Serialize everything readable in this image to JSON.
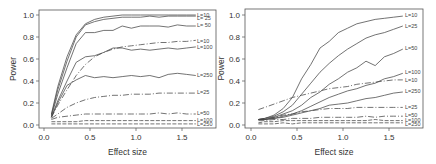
{
  "chart_data": [
    {
      "type": "line",
      "panel": "left",
      "title": "",
      "xlabel": "Effect size",
      "ylabel": "Power",
      "xlim": [
        -0.05,
        1.85
      ],
      "ylim": [
        -0.03,
        1.05
      ],
      "xticks": [
        "0.0",
        "0.5",
        "1.0",
        "1.5"
      ],
      "yticks": [
        "0.0",
        "0.2",
        "0.4",
        "0.6",
        "0.8",
        "1.0"
      ],
      "grid": false,
      "legend": "inline-right",
      "x": [
        0.08,
        0.15,
        0.25,
        0.35,
        0.45,
        0.55,
        0.65,
        0.75,
        0.85,
        0.95,
        1.05,
        1.15,
        1.25,
        1.35,
        1.45,
        1.55,
        1.65
      ],
      "series": [
        {
          "name": "L=10",
          "style": "solid",
          "values": [
            0.1,
            0.35,
            0.62,
            0.82,
            0.92,
            0.96,
            0.98,
            0.99,
            1.0,
            1.0,
            1.0,
            1.0,
            1.0,
            1.0,
            1.0,
            1.0,
            1.0
          ]
        },
        {
          "name": "L= 25",
          "style": "solid",
          "values": [
            0.09,
            0.32,
            0.58,
            0.8,
            0.91,
            0.94,
            0.96,
            0.97,
            0.98,
            0.98,
            0.98,
            0.99,
            0.98,
            0.99,
            0.99,
            0.99,
            0.99
          ]
        },
        {
          "name": "L= 50",
          "style": "solid",
          "values": [
            0.08,
            0.28,
            0.52,
            0.74,
            0.84,
            0.84,
            0.86,
            0.86,
            0.9,
            0.88,
            0.9,
            0.9,
            0.9,
            0.89,
            0.91,
            0.9,
            0.9
          ]
        },
        {
          "name": "L=10",
          "style": "dashdot",
          "values": [
            0.07,
            0.18,
            0.32,
            0.45,
            0.55,
            0.62,
            0.66,
            0.69,
            0.71,
            0.72,
            0.73,
            0.74,
            0.75,
            0.75,
            0.76,
            0.76,
            0.77
          ]
        },
        {
          "name": "L=100",
          "style": "solid",
          "values": [
            0.07,
            0.22,
            0.4,
            0.57,
            0.62,
            0.63,
            0.66,
            0.7,
            0.7,
            0.68,
            0.69,
            0.68,
            0.69,
            0.7,
            0.69,
            0.7,
            0.71
          ]
        },
        {
          "name": "L=250",
          "style": "solid",
          "values": [
            0.07,
            0.2,
            0.36,
            0.41,
            0.45,
            0.43,
            0.44,
            0.43,
            0.44,
            0.45,
            0.44,
            0.45,
            0.43,
            0.46,
            0.47,
            0.46,
            0.45
          ]
        },
        {
          "name": "L=25",
          "style": "dashdot",
          "values": [
            0.06,
            0.1,
            0.16,
            0.2,
            0.23,
            0.25,
            0.26,
            0.27,
            0.27,
            0.28,
            0.28,
            0.28,
            0.29,
            0.29,
            0.29,
            0.29,
            0.29
          ]
        },
        {
          "name": "L=50",
          "style": "dashdot",
          "values": [
            0.05,
            0.07,
            0.08,
            0.09,
            0.1,
            0.1,
            0.1,
            0.1,
            0.1,
            0.1,
            0.1,
            0.1,
            0.11,
            0.1,
            0.11,
            0.1,
            0.1
          ]
        },
        {
          "name": "L=100",
          "style": "dashed",
          "values": [
            0.03,
            0.03,
            0.03,
            0.03,
            0.04,
            0.04,
            0.04,
            0.04,
            0.04,
            0.04,
            0.04,
            0.04,
            0.04,
            0.04,
            0.04,
            0.04,
            0.04
          ]
        },
        {
          "name": "L=250",
          "style": "dashed",
          "values": [
            0.01,
            0.01,
            0.01,
            0.01,
            0.01,
            0.01,
            0.01,
            0.01,
            0.01,
            0.01,
            0.01,
            0.01,
            0.01,
            0.01,
            0.01,
            0.01,
            0.01
          ]
        }
      ]
    },
    {
      "type": "line",
      "panel": "right",
      "title": "",
      "xlabel": "Effect size",
      "ylabel": "Power",
      "xlim": [
        -0.05,
        1.85
      ],
      "ylim": [
        -0.03,
        1.05
      ],
      "xticks": [
        "0.0",
        "0.5",
        "1.0",
        "1.5"
      ],
      "yticks": [
        "0.0",
        "0.2",
        "0.4",
        "0.6",
        "0.8",
        "1.0"
      ],
      "grid": false,
      "legend": "inline-right",
      "x": [
        0.08,
        0.15,
        0.25,
        0.35,
        0.45,
        0.55,
        0.65,
        0.75,
        0.85,
        0.95,
        1.05,
        1.15,
        1.25,
        1.35,
        1.45,
        1.55,
        1.65
      ],
      "series": [
        {
          "name": "L=10",
          "style": "solid",
          "values": [
            0.05,
            0.06,
            0.09,
            0.15,
            0.25,
            0.42,
            0.55,
            0.7,
            0.76,
            0.84,
            0.88,
            0.92,
            0.94,
            0.96,
            0.97,
            0.98,
            0.99
          ]
        },
        {
          "name": "L=25",
          "style": "solid",
          "values": [
            0.05,
            0.06,
            0.08,
            0.12,
            0.18,
            0.28,
            0.38,
            0.48,
            0.56,
            0.63,
            0.69,
            0.74,
            0.79,
            0.82,
            0.84,
            0.87,
            0.9
          ]
        },
        {
          "name": "L=50",
          "style": "solid",
          "values": [
            0.05,
            0.05,
            0.07,
            0.1,
            0.13,
            0.18,
            0.25,
            0.3,
            0.37,
            0.42,
            0.48,
            0.52,
            0.58,
            0.54,
            0.62,
            0.65,
            0.69
          ]
        },
        {
          "name": "L=100",
          "style": "solid",
          "values": [
            0.05,
            0.05,
            0.06,
            0.08,
            0.1,
            0.13,
            0.17,
            0.21,
            0.25,
            0.28,
            0.31,
            0.33,
            0.36,
            0.38,
            0.42,
            0.44,
            0.47
          ]
        },
        {
          "name": "L=10",
          "style": "dashdot",
          "values": [
            0.14,
            0.16,
            0.19,
            0.22,
            0.25,
            0.27,
            0.29,
            0.31,
            0.33,
            0.34,
            0.35,
            0.37,
            0.38,
            0.39,
            0.4,
            0.41,
            0.41
          ]
        },
        {
          "name": "L=250",
          "style": "solid",
          "values": [
            0.05,
            0.05,
            0.06,
            0.07,
            0.09,
            0.11,
            0.13,
            0.15,
            0.18,
            0.19,
            0.2,
            0.22,
            0.24,
            0.25,
            0.27,
            0.29,
            0.3
          ]
        },
        {
          "name": "L=25",
          "style": "dashdot",
          "values": [
            0.05,
            0.06,
            0.07,
            0.09,
            0.1,
            0.12,
            0.13,
            0.14,
            0.15,
            0.15,
            0.15,
            0.16,
            0.16,
            0.16,
            0.16,
            0.16,
            0.16
          ]
        },
        {
          "name": "L=50",
          "style": "dashdot",
          "values": [
            0.04,
            0.04,
            0.05,
            0.05,
            0.06,
            0.06,
            0.06,
            0.07,
            0.07,
            0.07,
            0.07,
            0.07,
            0.08,
            0.07,
            0.08,
            0.08,
            0.08
          ]
        },
        {
          "name": "L=100",
          "style": "dashed",
          "values": [
            0.02,
            0.03,
            0.03,
            0.04,
            0.04,
            0.04,
            0.04,
            0.04,
            0.04,
            0.04,
            0.04,
            0.04,
            0.04,
            0.05,
            0.04,
            0.04,
            0.04
          ]
        },
        {
          "name": "L=250",
          "style": "dashed",
          "values": [
            0.01,
            0.01,
            0.01,
            0.02,
            0.01,
            0.02,
            0.02,
            0.02,
            0.02,
            0.02,
            0.02,
            0.02,
            0.02,
            0.02,
            0.02,
            0.02,
            0.02
          ]
        }
      ]
    }
  ],
  "label_positions": {
    "left": [
      {
        "text": "L=10",
        "y": 1.0
      },
      {
        "text": "L= 25",
        "y": 0.975
      },
      {
        "text": "L= 50",
        "y": 0.905
      },
      {
        "text": "L=10",
        "y": 0.765
      },
      {
        "text": "L=100",
        "y": 0.71
      },
      {
        "text": "L=250",
        "y": 0.455
      },
      {
        "text": "L=25",
        "y": 0.3
      },
      {
        "text": "L=50",
        "y": 0.11
      },
      {
        "text": "L=100",
        "y": 0.05
      },
      {
        "text": "L=250",
        "y": 0.01
      }
    ],
    "right": [
      {
        "text": "L=10",
        "y": 1.0
      },
      {
        "text": "L=25",
        "y": 0.9
      },
      {
        "text": "L=50",
        "y": 0.7
      },
      {
        "text": "L=100",
        "y": 0.48
      },
      {
        "text": "L=10",
        "y": 0.41
      },
      {
        "text": "L=250",
        "y": 0.31
      },
      {
        "text": "L=25",
        "y": 0.16
      },
      {
        "text": "L=50",
        "y": 0.09
      },
      {
        "text": "L=100",
        "y": 0.05
      },
      {
        "text": "L=250",
        "y": 0.01
      }
    ]
  }
}
